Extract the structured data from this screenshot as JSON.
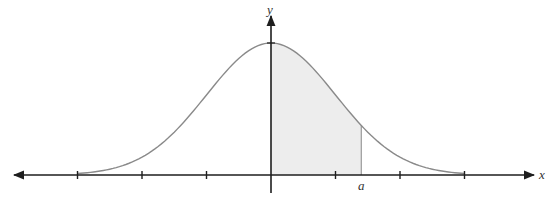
{
  "figure": {
    "x_axis_label": "x",
    "y_axis_label": "y",
    "shade_label": "a",
    "colors": {
      "axis": "#1e1e1e",
      "curve": "#8a8a8a",
      "shade": "#ededed",
      "shade_edge": "#9a9a9a"
    }
  },
  "chart_data": {
    "type": "area",
    "title": "",
    "xlabel": "x",
    "ylabel": "y",
    "curve": "normal density, mean 0, sd 1",
    "x_ticks": [
      -3,
      -2,
      -1,
      0,
      1,
      2,
      3
    ],
    "shaded_interval": {
      "from": 0,
      "to": "a",
      "approx_value": 1.4
    },
    "annotations": [
      "a"
    ],
    "grid": false
  }
}
